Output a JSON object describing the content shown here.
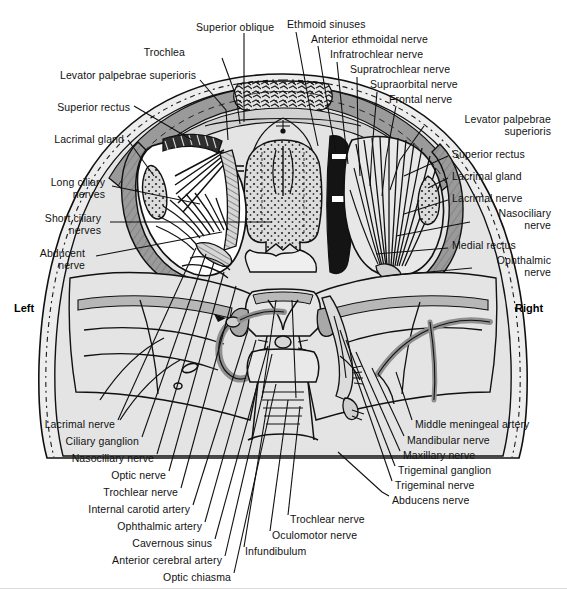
{
  "figure": {
    "kind": "anatomical-illustration",
    "orientation": {
      "left_label": "Left",
      "right_label": "Right"
    },
    "colors": {
      "ink": "#111111",
      "background": "#ffffff",
      "tissue_light": "#e9e9e9",
      "tissue_mid": "#c9c9c9",
      "bone_band": "#9a9a9a",
      "dark_fill": "#141414",
      "vessel": "#8f8f8f"
    }
  },
  "labels": {
    "top_left": [
      {
        "text": "Superior oblique",
        "x": 196,
        "y": 27,
        "align": "left"
      },
      {
        "text": "Trochlea",
        "x": 185,
        "y": 52,
        "align": "right"
      },
      {
        "text": "Levator palpebrae superioris",
        "x": 196,
        "y": 75,
        "align": "right"
      },
      {
        "text": "Superior rectus",
        "x": 130,
        "y": 107,
        "align": "right"
      },
      {
        "text": "Lacrimal gland",
        "x": 124,
        "y": 139,
        "align": "right"
      }
    ],
    "mid_left": [
      {
        "text": "Long ciliary\nnerves",
        "x": 105,
        "y": 182,
        "align": "right"
      },
      {
        "text": "Short ciliary\nnerves",
        "x": 101,
        "y": 218,
        "align": "right"
      },
      {
        "text": "Abducent\nnerve",
        "x": 85,
        "y": 253,
        "align": "right"
      }
    ],
    "top_right": [
      {
        "text": "Ethmoid sinuses",
        "x": 287,
        "y": 24,
        "align": "left"
      },
      {
        "text": "Anterior ethmoidal nerve",
        "x": 311,
        "y": 39,
        "align": "left"
      },
      {
        "text": "Infratrochlear nerve",
        "x": 330,
        "y": 54,
        "align": "left"
      },
      {
        "text": "Supratrochlear nerve",
        "x": 350,
        "y": 69,
        "align": "left"
      },
      {
        "text": "Supraorbital nerve",
        "x": 370,
        "y": 84,
        "align": "left"
      },
      {
        "text": "Frontal nerve",
        "x": 389,
        "y": 99,
        "align": "left"
      },
      {
        "text": "Levator palpebrae\nsuperioris",
        "x": 427,
        "y": 121,
        "align": "left"
      }
    ],
    "mid_right": [
      {
        "text": "Superior rectus",
        "x": 452,
        "y": 154,
        "align": "left"
      },
      {
        "text": "Lacrimal gland",
        "x": 452,
        "y": 176,
        "align": "left"
      },
      {
        "text": "Lacrimal nerve",
        "x": 452,
        "y": 198,
        "align": "left"
      },
      {
        "text": "Nasociliary\nnerve",
        "x": 475,
        "y": 213,
        "align": "left"
      },
      {
        "text": "Medial rectus",
        "x": 452,
        "y": 245,
        "align": "left"
      },
      {
        "text": "Ophthalmic\nnerve",
        "x": 477,
        "y": 260,
        "align": "left"
      }
    ],
    "bottom_left": [
      {
        "text": "Lacrimal nerve",
        "x": 115,
        "y": 424,
        "align": "right"
      },
      {
        "text": "Ciliary ganglion",
        "x": 139,
        "y": 441,
        "align": "right"
      },
      {
        "text": "Nasociliary nerve",
        "x": 154,
        "y": 458,
        "align": "right"
      },
      {
        "text": "Optic nerve",
        "x": 166,
        "y": 475,
        "align": "right"
      },
      {
        "text": "Trochlear nerve",
        "x": 178,
        "y": 492,
        "align": "right"
      },
      {
        "text": "Internal carotid artery",
        "x": 190,
        "y": 509,
        "align": "right"
      },
      {
        "text": "Ophthalmic artery",
        "x": 202,
        "y": 526,
        "align": "right"
      },
      {
        "text": "Cavernous sinus",
        "x": 212,
        "y": 543,
        "align": "right"
      },
      {
        "text": "Anterior cerebral artery",
        "x": 222,
        "y": 560,
        "align": "right"
      },
      {
        "text": "Optic chiasma",
        "x": 231,
        "y": 577,
        "align": "right"
      }
    ],
    "bottom_center": [
      {
        "text": "Infundibulum",
        "x": 245,
        "y": 551,
        "align": "left"
      },
      {
        "text": "Oculomotor nerve",
        "x": 272,
        "y": 535,
        "align": "left"
      },
      {
        "text": "Trochlear nerve",
        "x": 290,
        "y": 519,
        "align": "left"
      }
    ],
    "bottom_right": [
      {
        "text": "Middle meningeal artery",
        "x": 415,
        "y": 424,
        "align": "left"
      },
      {
        "text": "Mandibular nerve",
        "x": 407,
        "y": 440,
        "align": "left"
      },
      {
        "text": "Maxillary nerve",
        "x": 403,
        "y": 455,
        "align": "left"
      },
      {
        "text": "Trigeminal ganglion",
        "x": 398,
        "y": 470,
        "align": "left"
      },
      {
        "text": "Trigeminal nerve",
        "x": 395,
        "y": 485,
        "align": "left"
      },
      {
        "text": "Abducens nerve",
        "x": 392,
        "y": 500,
        "align": "left"
      }
    ]
  }
}
